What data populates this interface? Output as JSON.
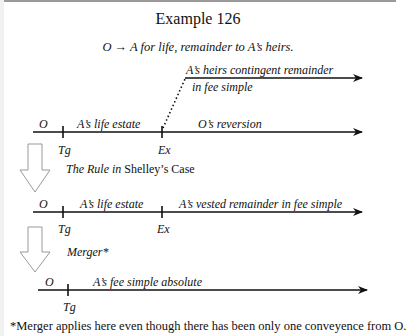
{
  "title": "Example 126",
  "subtitle": "O → A for life, remainder to A’s heirs.",
  "timeline1": {
    "start_label": "O",
    "segment1": "A’s life estate",
    "segment2": "O’s reversion",
    "tick1": "Tg",
    "tick2": "Ex",
    "branch_line1": "A’s heirs contingent remainder",
    "branch_line2": "in fee simple"
  },
  "transition1": {
    "italic_part": "The Rule in",
    "plain_part": "Shelley’s Case"
  },
  "timeline2": {
    "start_label": "O",
    "segment1": "A’s life estate",
    "segment2": "A’s vested remainder in fee simple",
    "tick1": "Tg",
    "tick2": "Ex"
  },
  "transition2": {
    "label": "Merger*"
  },
  "timeline3": {
    "start_label": "O",
    "segment1": "A’s fee simple absolute",
    "tick1": "Tg"
  },
  "footnote": "*Merger applies here even though there has been only one conveyence from O."
}
